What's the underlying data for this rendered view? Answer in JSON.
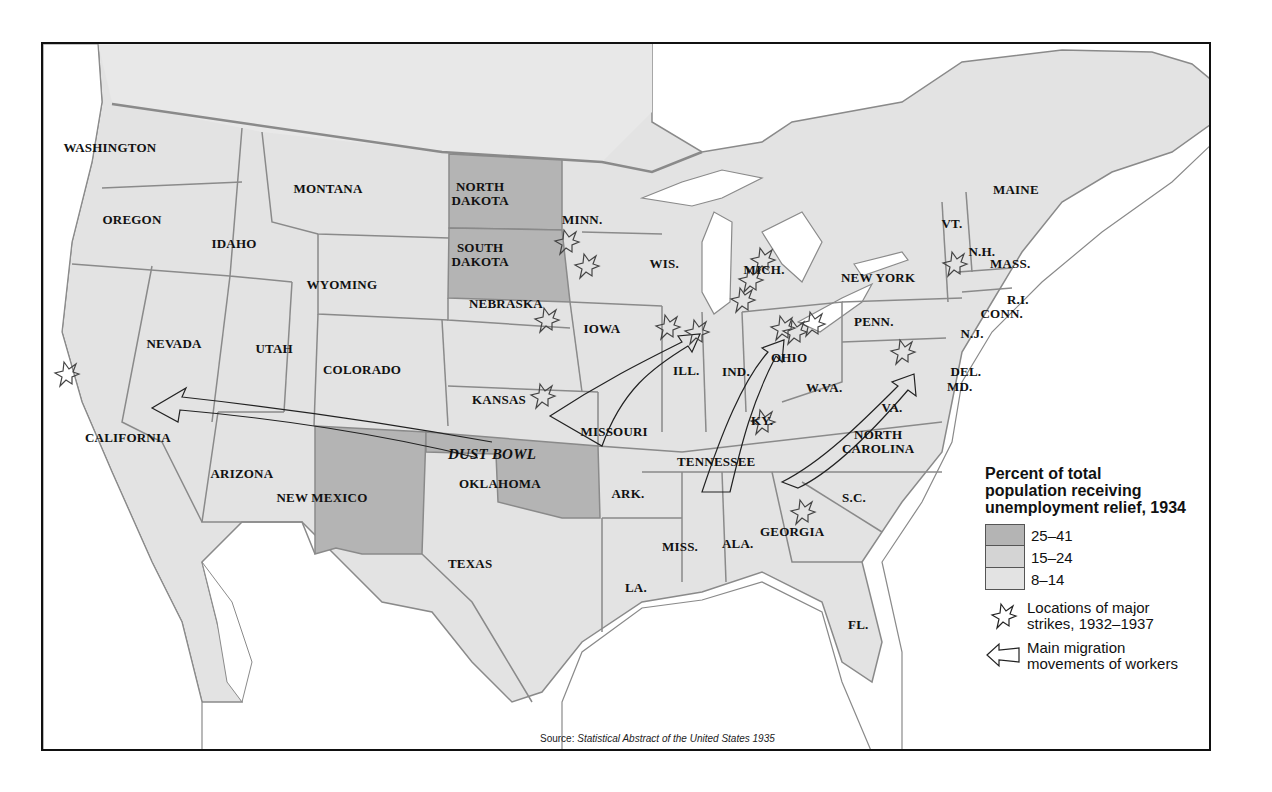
{
  "map": {
    "title_context": "Unemployment relief, strikes and migration, 1930s United States",
    "colors": {
      "land_light": "#e3e3e3",
      "land_medium": "#d4d4d4",
      "land_dark": "#b4b4b4",
      "water": "#ffffff",
      "border": "#8a8a8a",
      "frame": "#111111"
    },
    "states": [
      {
        "name": "WASHINGTON",
        "x": 108,
        "y": 146
      },
      {
        "name": "OREGON",
        "x": 130,
        "y": 218
      },
      {
        "name": "IDAHO",
        "x": 232,
        "y": 242
      },
      {
        "name": "MONTANA",
        "x": 326,
        "y": 187
      },
      {
        "name": "NORTH\nDAKOTA",
        "x": 478,
        "y": 192
      },
      {
        "name": "SOUTH\nDAKOTA",
        "x": 478,
        "y": 253
      },
      {
        "name": "MINN.",
        "x": 580,
        "y": 218
      },
      {
        "name": "WIS.",
        "x": 662,
        "y": 262
      },
      {
        "name": "MICH.",
        "x": 762,
        "y": 268
      },
      {
        "name": "WYOMING",
        "x": 340,
        "y": 283
      },
      {
        "name": "NEVADA",
        "x": 172,
        "y": 342
      },
      {
        "name": "UTAH",
        "x": 272,
        "y": 347
      },
      {
        "name": "COLORADO",
        "x": 360,
        "y": 368
      },
      {
        "name": "NEBRASKA",
        "x": 504,
        "y": 302
      },
      {
        "name": "IOWA",
        "x": 600,
        "y": 327
      },
      {
        "name": "KANSAS",
        "x": 497,
        "y": 398
      },
      {
        "name": "ILL.",
        "x": 684,
        "y": 369
      },
      {
        "name": "IND.",
        "x": 734,
        "y": 370
      },
      {
        "name": "OHIO",
        "x": 787,
        "y": 356
      },
      {
        "name": "PENN.",
        "x": 872,
        "y": 320
      },
      {
        "name": "NEW YORK",
        "x": 876,
        "y": 276
      },
      {
        "name": "MAINE",
        "x": 1014,
        "y": 188
      },
      {
        "name": "VT.",
        "x": 950,
        "y": 222
      },
      {
        "name": "N.H.",
        "x": 980,
        "y": 250
      },
      {
        "name": "MASS.",
        "x": 1008,
        "y": 262
      },
      {
        "name": "R.I.",
        "x": 1016,
        "y": 298
      },
      {
        "name": "CONN.",
        "x": 1000,
        "y": 312
      },
      {
        "name": "N.J.",
        "x": 970,
        "y": 332
      },
      {
        "name": "DEL.",
        "x": 964,
        "y": 370
      },
      {
        "name": "MD.",
        "x": 958,
        "y": 385
      },
      {
        "name": "W.VA.",
        "x": 822,
        "y": 386
      },
      {
        "name": "VA.",
        "x": 890,
        "y": 406
      },
      {
        "name": "KY.",
        "x": 760,
        "y": 419
      },
      {
        "name": "MISSOURI",
        "x": 612,
        "y": 430
      },
      {
        "name": "CALIFORNIA",
        "x": 126,
        "y": 436
      },
      {
        "name": "ARIZONA",
        "x": 240,
        "y": 472
      },
      {
        "name": "NEW MEXICO",
        "x": 320,
        "y": 496
      },
      {
        "name": "OKLAHOMA",
        "x": 498,
        "y": 482
      },
      {
        "name": "TENNESSEE",
        "x": 714,
        "y": 460
      },
      {
        "name": "NORTH\nCAROLINA",
        "x": 876,
        "y": 440
      },
      {
        "name": "ARK.",
        "x": 626,
        "y": 492
      },
      {
        "name": "S.C.",
        "x": 852,
        "y": 496
      },
      {
        "name": "MISS.",
        "x": 678,
        "y": 545
      },
      {
        "name": "ALA.",
        "x": 736,
        "y": 542
      },
      {
        "name": "GEORGIA",
        "x": 790,
        "y": 530
      },
      {
        "name": "TEXAS",
        "x": 468,
        "y": 562
      },
      {
        "name": "LA.",
        "x": 634,
        "y": 586
      },
      {
        "name": "FL.",
        "x": 856,
        "y": 623
      }
    ],
    "region_labels": [
      {
        "name": "DUST BOWL",
        "x": 490,
        "y": 452
      }
    ]
  },
  "legend": {
    "title": "Percent of total population receiving unemployment relief, 1934",
    "title_lines": [
      "Percent of total",
      "population receiving",
      "unemployment relief, 1934"
    ],
    "classes": [
      {
        "range": "25–41",
        "color": "#b4b4b4",
        "states": [
          "NORTH DAKOTA",
          "SOUTH DAKOTA",
          "NEW MEXICO",
          "OKLAHOMA"
        ]
      },
      {
        "range": "15–24",
        "color": "#d4d4d4"
      },
      {
        "range": "8–14",
        "color": "#e3e3e3"
      }
    ],
    "strike_symbol": {
      "icon": "starburst-icon",
      "lines": [
        "Locations of major",
        "strikes, 1932–1937"
      ]
    },
    "migration_symbol": {
      "icon": "hollow-arrow-icon",
      "lines": [
        "Main migration",
        "movements of workers"
      ]
    }
  },
  "strikes": [
    {
      "x": 564,
      "y": 240
    },
    {
      "x": 584,
      "y": 264
    },
    {
      "x": 544,
      "y": 318
    },
    {
      "x": 540,
      "y": 394
    },
    {
      "x": 665,
      "y": 325
    },
    {
      "x": 694,
      "y": 330
    },
    {
      "x": 740,
      "y": 298
    },
    {
      "x": 748,
      "y": 278
    },
    {
      "x": 760,
      "y": 258
    },
    {
      "x": 780,
      "y": 326
    },
    {
      "x": 792,
      "y": 330
    },
    {
      "x": 810,
      "y": 322
    },
    {
      "x": 760,
      "y": 420
    },
    {
      "x": 900,
      "y": 350
    },
    {
      "x": 952,
      "y": 262
    },
    {
      "x": 800,
      "y": 510
    },
    {
      "x": 64,
      "y": 372
    }
  ],
  "source": {
    "prefix": "Source: ",
    "title": "Statistical Abstract of the United States 1935"
  }
}
